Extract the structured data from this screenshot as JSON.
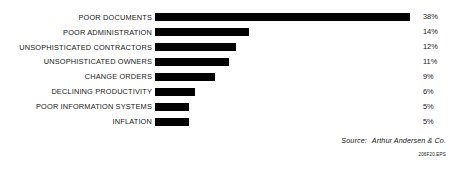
{
  "chart_data": {
    "type": "bar",
    "orientation": "horizontal",
    "title": "",
    "xlabel": "",
    "ylabel": "",
    "grid": false,
    "legend": null,
    "xlim": [
      0,
      38
    ],
    "categories": [
      "POOR DOCUMENTS",
      "POOR ADMINISTRATION",
      "UNSOPHISTICATED CONTRACTORS",
      "UNSOPHISTICATED OWNERS",
      "CHANGE ORDERS",
      "DECLINING PRODUCTIVITY",
      "POOR INFORMATION SYSTEMS",
      "INFLATION"
    ],
    "values": [
      38,
      14,
      12,
      11,
      9,
      6,
      5,
      5
    ],
    "value_labels": [
      "38%",
      "14%",
      "12%",
      "11%",
      "9%",
      "6%",
      "5%",
      "5%"
    ],
    "bar_color": "#000000",
    "background_color": "#ffffff"
  },
  "footer": {
    "source_label": "Source:",
    "source_value": "Arthur Andersen & Co.",
    "eps_code": "206F20.EPS"
  }
}
